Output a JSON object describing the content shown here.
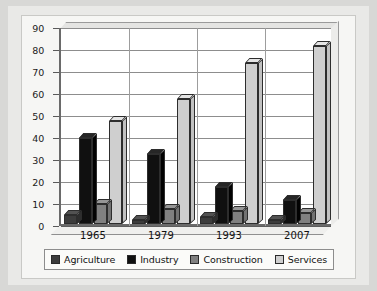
{
  "chart_data": {
    "type": "bar",
    "title": "",
    "subtitle": "",
    "xlabel": "",
    "ylabel": "",
    "categories": [
      "1965",
      "1979",
      "1993",
      "2007"
    ],
    "ylim": [
      0,
      90
    ],
    "yticks": [
      0,
      10,
      20,
      30,
      40,
      50,
      60,
      70,
      80,
      90
    ],
    "ytick_labels": [
      "0",
      "10",
      "20",
      "30",
      "40",
      "50",
      "60",
      "70",
      "80",
      "90"
    ],
    "grid": true,
    "legend_position": "bottom",
    "series": [
      {
        "name": "Agriculture",
        "color": "#3c3c3c",
        "values": [
          4,
          2,
          3,
          2
        ]
      },
      {
        "name": "Industry",
        "color": "#101010",
        "values": [
          39,
          32,
          17,
          11
        ]
      },
      {
        "name": "Construction",
        "color": "#808080",
        "values": [
          9,
          7,
          6,
          5
        ]
      },
      {
        "name": "Services",
        "color": "#cfcfcf",
        "values": [
          47,
          57,
          73,
          81
        ]
      }
    ]
  },
  "legend": {
    "items": [
      {
        "label": "Agriculture"
      },
      {
        "label": "Industry"
      },
      {
        "label": "Construction"
      },
      {
        "label": "Services"
      }
    ]
  }
}
